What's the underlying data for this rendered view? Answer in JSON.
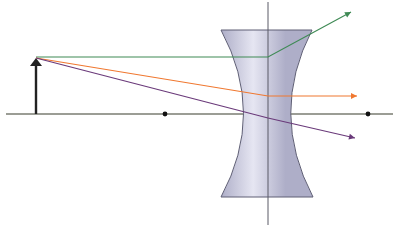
{
  "diagram": {
    "type": "ray-diagram",
    "colors": {
      "background": "#ffffff",
      "axis": "#7a7d72",
      "lens_fill": "#aeaec8",
      "lens_highlight": "#e6e6f2",
      "lens_edge": "#5e5e74",
      "lens_plane": "#5a5a66",
      "object": "#222222",
      "focal_point": "#111111",
      "ray_parallel": "#3f8a55",
      "ray_focal": "#f07830",
      "ray_center": "#6a3a7a"
    },
    "optical_axis": {
      "x1": 6,
      "y": 114,
      "x2": 393
    },
    "lens_plane": {
      "x": 268,
      "y1": 2,
      "y2": 225
    },
    "lens": {
      "top_y": 30,
      "bottom_y": 197,
      "top_left_x": 221,
      "top_right_x": 312,
      "waist_left_x": 252,
      "waist_right_x": 283
    },
    "object": {
      "x": 36,
      "base_y": 114,
      "tip_y": 58
    },
    "focal_points": [
      {
        "name": "F-left",
        "x": 165,
        "y": 114
      },
      {
        "name": "F-right",
        "x": 368,
        "y": 114
      }
    ],
    "rays": [
      {
        "name": "parallel-ray",
        "color_key": "ray_parallel",
        "points": [
          [
            36,
            57
          ],
          [
            268,
            57
          ],
          [
            351,
            12
          ]
        ]
      },
      {
        "name": "focal-ray",
        "color_key": "ray_focal",
        "points": [
          [
            36,
            58
          ],
          [
            268,
            96
          ],
          [
            357,
            96
          ]
        ]
      },
      {
        "name": "center-ray",
        "color_key": "ray_center",
        "points": [
          [
            36,
            58
          ],
          [
            268,
            118
          ],
          [
            355,
            138
          ]
        ]
      }
    ]
  }
}
